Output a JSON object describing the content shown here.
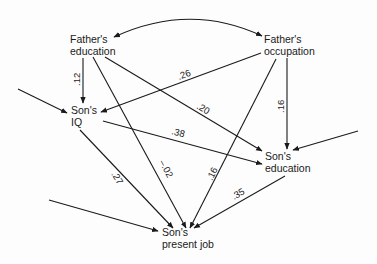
{
  "diagram": {
    "type": "path-diagram",
    "nodes": {
      "fathers_education": {
        "line1": "Father's",
        "line2": "education"
      },
      "fathers_occupation": {
        "line1": "Father's",
        "line2": "occupation"
      },
      "sons_iq": {
        "line1": "Son's",
        "line2": "IQ"
      },
      "sons_education": {
        "line1": "Son's",
        "line2": "education"
      },
      "sons_present_job": {
        "line1": "Son's",
        "line2": "present job"
      }
    },
    "edges": [
      {
        "from": "Father's education",
        "to": "Father's occupation",
        "kind": "correlation",
        "label": ""
      },
      {
        "from": "Father's education",
        "to": "Son's IQ",
        "label": ".12"
      },
      {
        "from": "Father's occupation",
        "to": "Son's IQ",
        "label": ".26"
      },
      {
        "from": "Father's education",
        "to": "Son's education",
        "label": ".20"
      },
      {
        "from": "Father's occupation",
        "to": "Son's education",
        "label": ".16"
      },
      {
        "from": "Son's IQ",
        "to": "Son's education",
        "label": ".38"
      },
      {
        "from": "Son's IQ",
        "to": "Son's present job",
        "label": ".27"
      },
      {
        "from": "Father's education",
        "to": "Son's present job",
        "label": "–.02"
      },
      {
        "from": "Father's occupation",
        "to": "Son's present job",
        "label": ".16"
      },
      {
        "from": "Son's education",
        "to": "Son's present job",
        "label": ".35"
      },
      {
        "from": "external",
        "to": "Son's IQ",
        "kind": "residual",
        "label": ""
      },
      {
        "from": "external",
        "to": "Son's education",
        "kind": "residual",
        "label": ""
      },
      {
        "from": "external",
        "to": "Son's present job",
        "kind": "residual",
        "label": ""
      }
    ],
    "labels": {
      "fe_iq": ".12",
      "fo_iq": ".26",
      "fe_se": ".20",
      "fo_se": ".16",
      "iq_se": ".38",
      "iq_job": ".27",
      "fe_job": "–.02",
      "fo_job": ".16",
      "se_job": ".35"
    }
  }
}
